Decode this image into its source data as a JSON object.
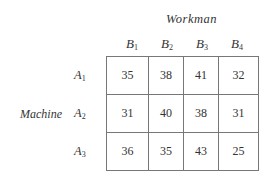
{
  "column_group_label": "Workman",
  "row_group_label": "Machine",
  "columns": [
    {
      "letter": "B",
      "sub": "1"
    },
    {
      "letter": "B",
      "sub": "2"
    },
    {
      "letter": "B",
      "sub": "3"
    },
    {
      "letter": "B",
      "sub": "4"
    }
  ],
  "rows": [
    {
      "letter": "A",
      "sub": "1",
      "values": [
        "35",
        "38",
        "41",
        "32"
      ]
    },
    {
      "letter": "A",
      "sub": "2",
      "values": [
        "31",
        "40",
        "38",
        "31"
      ]
    },
    {
      "letter": "A",
      "sub": "3",
      "values": [
        "36",
        "35",
        "43",
        "25"
      ]
    }
  ]
}
